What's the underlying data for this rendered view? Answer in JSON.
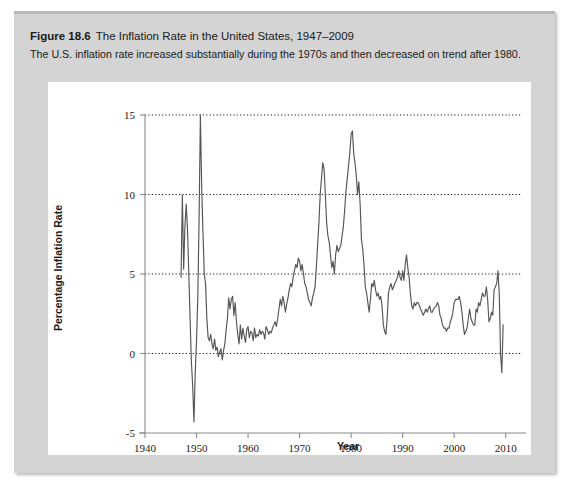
{
  "figure": {
    "number": "Figure 18.6",
    "title": "The Inflation Rate in the United States, 1947–2009",
    "subtitle": "The U.S. inflation rate increased substantially during the 1970s and then decreased on trend after 1980.",
    "panel_color": "#d4d4d4",
    "card_color": "#ffffff"
  },
  "chart_data": {
    "type": "line",
    "title": "The Inflation Rate in the United States, 1947–2009",
    "xlabel": "Year",
    "ylabel": "Percentage Inflation Rate",
    "xlim": [
      1940,
      2012
    ],
    "ylim": [
      -5,
      15
    ],
    "xticks": [
      1940,
      1950,
      1960,
      1970,
      1980,
      1990,
      2000,
      2010
    ],
    "yticks": [
      -5,
      0,
      5,
      10,
      15
    ],
    "grid": "horizontal-dotted",
    "gridlines": [
      0,
      5,
      10,
      15
    ],
    "legend": "none",
    "line_color": "#555555",
    "series": [
      {
        "name": "Percentage Inflation Rate",
        "x": [
          1947.0,
          1947.25,
          1947.5,
          1947.75,
          1948.0,
          1948.25,
          1948.5,
          1948.75,
          1949.0,
          1949.25,
          1949.5,
          1949.75,
          1950.0,
          1950.25,
          1950.5,
          1950.75,
          1951.0,
          1951.25,
          1951.5,
          1951.75,
          1952.0,
          1952.25,
          1952.5,
          1952.75,
          1953.0,
          1953.25,
          1953.5,
          1953.75,
          1954.0,
          1954.25,
          1954.5,
          1954.75,
          1955.0,
          1955.25,
          1955.5,
          1955.75,
          1956.0,
          1956.25,
          1956.5,
          1956.75,
          1957.0,
          1957.25,
          1957.5,
          1957.75,
          1958.0,
          1958.25,
          1958.5,
          1958.75,
          1959.0,
          1959.25,
          1959.5,
          1959.75,
          1960.0,
          1960.25,
          1960.5,
          1960.75,
          1961.0,
          1961.25,
          1961.5,
          1961.75,
          1962.0,
          1962.25,
          1962.5,
          1962.75,
          1963.0,
          1963.25,
          1963.5,
          1963.75,
          1964.0,
          1964.25,
          1964.5,
          1964.75,
          1965.0,
          1965.25,
          1965.5,
          1965.75,
          1966.0,
          1966.25,
          1966.5,
          1966.75,
          1967.0,
          1967.25,
          1967.5,
          1967.75,
          1968.0,
          1968.25,
          1968.5,
          1968.75,
          1969.0,
          1969.25,
          1969.5,
          1969.75,
          1970.0,
          1970.25,
          1970.5,
          1970.75,
          1971.0,
          1971.25,
          1971.5,
          1971.75,
          1972.0,
          1972.25,
          1972.5,
          1972.75,
          1973.0,
          1973.25,
          1973.5,
          1973.75,
          1974.0,
          1974.25,
          1974.5,
          1974.75,
          1975.0,
          1975.25,
          1975.5,
          1975.75,
          1976.0,
          1976.25,
          1976.5,
          1976.75,
          1977.0,
          1977.25,
          1977.5,
          1977.75,
          1978.0,
          1978.25,
          1978.5,
          1978.75,
          1979.0,
          1979.25,
          1979.5,
          1979.75,
          1980.0,
          1980.25,
          1980.5,
          1980.75,
          1981.0,
          1981.25,
          1981.5,
          1981.75,
          1982.0,
          1982.25,
          1982.5,
          1982.75,
          1983.0,
          1983.25,
          1983.5,
          1983.75,
          1984.0,
          1984.25,
          1984.5,
          1984.75,
          1985.0,
          1985.25,
          1985.5,
          1985.75,
          1986.0,
          1986.25,
          1986.5,
          1986.75,
          1987.0,
          1987.25,
          1987.5,
          1987.75,
          1988.0,
          1988.25,
          1988.5,
          1988.75,
          1989.0,
          1989.25,
          1989.5,
          1989.75,
          1990.0,
          1990.25,
          1990.5,
          1990.75,
          1991.0,
          1991.25,
          1991.5,
          1991.75,
          1992.0,
          1992.25,
          1992.5,
          1992.75,
          1993.0,
          1993.25,
          1993.5,
          1993.75,
          1994.0,
          1994.25,
          1994.5,
          1994.75,
          1995.0,
          1995.25,
          1995.5,
          1995.75,
          1996.0,
          1996.25,
          1996.5,
          1996.75,
          1997.0,
          1997.25,
          1997.5,
          1997.75,
          1998.0,
          1998.25,
          1998.5,
          1998.75,
          1999.0,
          1999.25,
          1999.5,
          1999.75,
          2000.0,
          2000.25,
          2000.5,
          2000.75,
          2001.0,
          2001.25,
          2001.5,
          2001.75,
          2002.0,
          2002.25,
          2002.5,
          2002.75,
          2003.0,
          2003.25,
          2003.5,
          2003.75,
          2004.0,
          2004.25,
          2004.5,
          2004.75,
          2005.0,
          2005.25,
          2005.5,
          2005.75,
          2006.0,
          2006.25,
          2006.5,
          2006.75,
          2007.0,
          2007.25,
          2007.5,
          2007.75,
          2008.0,
          2008.25,
          2008.5,
          2008.75,
          2009.0,
          2009.25,
          2009.5
        ],
        "y": [
          4.8,
          10.0,
          5.3,
          8.0,
          9.4,
          7.8,
          5.0,
          2.2,
          -0.5,
          -2.0,
          -4.3,
          -1.2,
          0.8,
          3.6,
          8.5,
          15.0,
          10.5,
          7.6,
          5.0,
          4.4,
          2.2,
          1.0,
          0.8,
          1.2,
          0.6,
          0.3,
          0.9,
          0.2,
          0.4,
          -0.2,
          0.1,
          0.3,
          -0.4,
          0.2,
          0.6,
          1.5,
          2.2,
          3.5,
          2.8,
          3.4,
          3.6,
          2.4,
          3.2,
          2.0,
          1.2,
          0.6,
          1.8,
          0.9,
          1.6,
          1.1,
          0.7,
          1.5,
          1.7,
          1.0,
          1.4,
          1.3,
          0.8,
          1.6,
          1.0,
          1.2,
          1.1,
          1.5,
          1.2,
          1.4,
          1.3,
          0.9,
          1.7,
          1.5,
          1.2,
          1.4,
          1.3,
          1.6,
          1.8,
          2.0,
          1.7,
          2.2,
          2.8,
          3.4,
          3.0,
          3.6,
          3.2,
          2.6,
          3.1,
          3.5,
          4.0,
          4.4,
          4.2,
          4.8,
          5.2,
          5.6,
          5.4,
          6.0,
          5.8,
          5.2,
          5.6,
          5.0,
          4.4,
          4.2,
          3.8,
          3.4,
          3.2,
          3.0,
          3.5,
          3.8,
          4.2,
          5.4,
          6.8,
          8.2,
          10.0,
          11.0,
          12.0,
          11.6,
          10.0,
          8.2,
          7.4,
          7.0,
          6.2,
          5.4,
          5.8,
          5.0,
          6.2,
          6.8,
          6.4,
          6.6,
          6.8,
          7.4,
          8.0,
          9.0,
          10.2,
          11.0,
          11.8,
          12.6,
          13.8,
          14.0,
          12.6,
          12.0,
          11.2,
          10.0,
          10.8,
          9.4,
          7.2,
          6.6,
          5.6,
          4.2,
          3.8,
          3.2,
          2.6,
          3.4,
          4.4,
          4.2,
          4.6,
          4.0,
          3.6,
          3.8,
          3.4,
          3.6,
          3.0,
          1.8,
          1.4,
          1.2,
          2.2,
          3.8,
          4.2,
          4.4,
          4.0,
          4.2,
          4.4,
          4.6,
          4.8,
          5.2,
          4.8,
          4.6,
          5.2,
          4.6,
          5.6,
          6.2,
          5.4,
          4.8,
          3.8,
          3.0,
          2.8,
          3.2,
          3.0,
          3.2,
          3.2,
          3.0,
          2.8,
          2.6,
          2.4,
          2.6,
          2.8,
          2.6,
          2.8,
          3.0,
          2.6,
          2.6,
          2.8,
          2.9,
          3.0,
          3.2,
          3.0,
          2.4,
          2.2,
          1.8,
          1.6,
          1.6,
          1.4,
          1.6,
          1.6,
          2.0,
          2.2,
          2.6,
          3.2,
          3.4,
          3.4,
          3.4,
          3.6,
          3.2,
          2.6,
          1.8,
          1.2,
          1.4,
          1.6,
          2.2,
          2.8,
          2.2,
          2.0,
          1.8,
          1.8,
          2.8,
          2.6,
          3.2,
          3.0,
          3.4,
          3.8,
          3.6,
          3.6,
          4.2,
          3.4,
          2.0,
          2.2,
          2.6,
          2.4,
          4.0,
          4.2,
          4.4,
          5.2,
          3.8,
          0.0,
          -1.2,
          1.8
        ]
      }
    ]
  }
}
